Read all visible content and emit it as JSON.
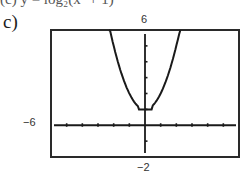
{
  "header": {
    "cut_text": "(c)  y = log₂(x² + 1)",
    "part_label": "c)"
  },
  "window": {
    "xmin_label": "−6",
    "ymax_label": "6",
    "ymin_label": "−2"
  },
  "chart_data": {
    "type": "line",
    "title": "",
    "xlabel": "",
    "ylabel": "",
    "xlim": [
      -6,
      6
    ],
    "ylim": [
      -2,
      6
    ],
    "xscale_tick": 1,
    "yscale_tick": 1,
    "grid": false,
    "legend": null,
    "tick_labels": {
      "left": "-6",
      "top": "6",
      "bottom": "-2"
    },
    "series": [
      {
        "name": "graph",
        "x": [
          -2.3,
          -2.0,
          -1.5,
          -1.0,
          -0.5,
          0,
          0.5,
          1.0,
          1.5,
          2.0,
          2.3
        ],
        "y": [
          6.0,
          5.0,
          3.25,
          2.0,
          1.25,
          1.0,
          1.25,
          2.0,
          3.25,
          5.0,
          6.0
        ]
      }
    ],
    "annotations": [
      "vertex near (0, 1)"
    ]
  },
  "colors": {
    "axis": "#1a1a1a",
    "curve": "#1a1a1a",
    "frame": "#2a2a2a"
  }
}
